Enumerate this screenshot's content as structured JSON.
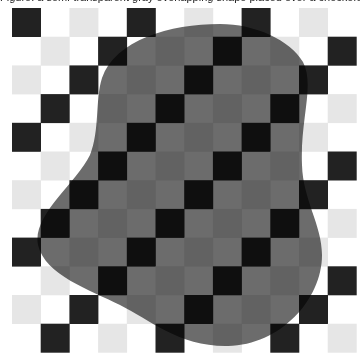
{
  "caption": {
    "text": "Figure: a semi-transparent gray overlapping shape placed over a checkerboard",
    "note": "clipped at top edge; only descenders visible"
  },
  "checkerboard": {
    "origin_x": 12,
    "origin_y": 8,
    "cell_size": 28.7,
    "columns": 12,
    "rows": 12,
    "colors": {
      "dark": "#222222",
      "light": "#e6e6e6",
      "background": "#ffffff"
    },
    "rule": "cells with (row+col) even are filled; ((row+col)/2) even -> dark, odd -> light"
  },
  "blob": {
    "fill": "#6c6c6c",
    "blend": "multiply",
    "path": "M 220 24 C 255 24 290 40 303 62 C 315 85 300 120 302 165 C 303 200 322 225 322 255 C 322 300 280 345 228 346 C 180 347 150 320 120 305 C 90 290 45 275 38 245 C 32 215 75 185 90 155 C 100 130 95 100 102 78 C 115 40 170 24 220 24 Z"
  }
}
